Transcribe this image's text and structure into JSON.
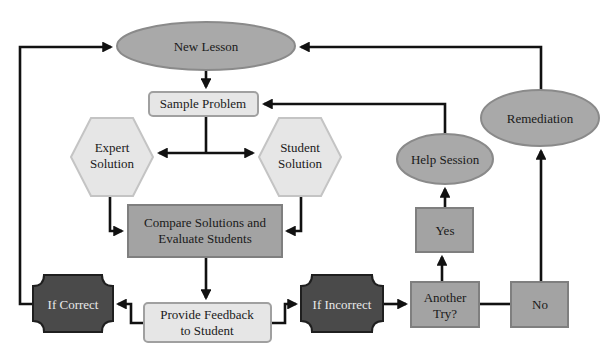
{
  "diagram": {
    "title": "",
    "colors": {
      "background": "#ffffff",
      "oval_fill": "#a9a9a9",
      "oval_stroke": "#8a8a8a",
      "light_fill": "#e6e6e6",
      "light_stroke": "#a0a0a0",
      "mid_fill": "#a3a3a3",
      "mid_stroke": "#7f7f7f",
      "dark_fill": "#4a4a4a",
      "dark_stroke": "#1f1f1f",
      "connector": "#111111"
    },
    "nodes": {
      "new_lesson": {
        "label": "New Lesson",
        "shape": "ellipse"
      },
      "sample_problem": {
        "label": "Sample Problem",
        "shape": "rounded-rect"
      },
      "expert_solution": {
        "line1": "Expert",
        "line2": "Solution",
        "shape": "hexagon"
      },
      "student_solution": {
        "line1": "Student",
        "line2": "Solution",
        "shape": "hexagon"
      },
      "compare": {
        "line1": "Compare Solutions and",
        "line2": "Evaluate Students",
        "shape": "rect"
      },
      "feedback": {
        "line1": "Provide Feedback",
        "line2": "to Student",
        "shape": "rounded-rect"
      },
      "if_correct": {
        "label": "If Correct",
        "shape": "notched-octagon"
      },
      "if_incorrect": {
        "label": "If Incorrect",
        "shape": "notched-octagon"
      },
      "another_try": {
        "line1": "Another",
        "line2": "Try?",
        "shape": "rect"
      },
      "yes": {
        "label": "Yes",
        "shape": "rect"
      },
      "no": {
        "label": "No",
        "shape": "rect"
      },
      "help_session": {
        "label": "Help Session",
        "shape": "ellipse"
      },
      "remediation": {
        "label": "Remediation",
        "shape": "ellipse"
      }
    },
    "edges": [
      {
        "from": "New Lesson",
        "to": "Sample Problem"
      },
      {
        "from": "Sample Problem",
        "to": "Expert Solution"
      },
      {
        "from": "Sample Problem",
        "to": "Student Solution"
      },
      {
        "from": "Expert Solution",
        "to": "Compare Solutions and Evaluate Students"
      },
      {
        "from": "Student Solution",
        "to": "Compare Solutions and Evaluate Students"
      },
      {
        "from": "Compare Solutions and Evaluate Students",
        "to": "Provide Feedback to Student"
      },
      {
        "from": "Provide Feedback to Student",
        "to": "If Correct"
      },
      {
        "from": "Provide Feedback to Student",
        "to": "If Incorrect"
      },
      {
        "from": "If Correct",
        "to": "New Lesson"
      },
      {
        "from": "If Incorrect",
        "to": "Another Try?"
      },
      {
        "from": "Another Try?",
        "to": "Yes"
      },
      {
        "from": "Another Try?",
        "to": "No"
      },
      {
        "from": "Yes",
        "to": "Help Session"
      },
      {
        "from": "Help Session",
        "to": "Sample Problem"
      },
      {
        "from": "No",
        "to": "Remediation"
      },
      {
        "from": "Remediation",
        "to": "New Lesson"
      }
    ]
  }
}
